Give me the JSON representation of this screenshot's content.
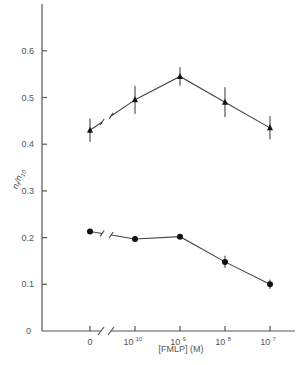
{
  "chart_data": {
    "type": "line",
    "title": "",
    "xlabel": "[FMLP] (M)",
    "ylabel": "n_f/n_10",
    "x_scale": "categorical (log concentration with axis break after 0)",
    "categories": [
      "0",
      "10^-10",
      "10^-9",
      "10^-8",
      "10^-7"
    ],
    "category_labels": [
      {
        "base": "0",
        "exp": ""
      },
      {
        "base": "10",
        "exp": "-10"
      },
      {
        "base": "10",
        "exp": "-9"
      },
      {
        "base": "10",
        "exp": "-8"
      },
      {
        "base": "10",
        "exp": "-7"
      }
    ],
    "yticks": [
      "0",
      "0.1",
      "0.2",
      "0.3",
      "0.4",
      "0.5",
      "0.6"
    ],
    "ylim": [
      0,
      0.7
    ],
    "grid": false,
    "legend": null,
    "axis_break_x": "between 0 and 10^-10",
    "series": [
      {
        "name": "triangles",
        "marker": "triangle",
        "values": [
          0.43,
          0.495,
          0.545,
          0.49,
          0.435
        ],
        "errors": [
          0.025,
          0.03,
          0.02,
          0.032,
          0.025
        ]
      },
      {
        "name": "circles",
        "marker": "circle",
        "values": [
          0.213,
          0.197,
          0.202,
          0.148,
          0.1
        ],
        "errors": [
          0.005,
          0.005,
          0.005,
          0.013,
          0.01
        ]
      }
    ]
  },
  "axes": {
    "x_title": "[FMLP] (M)",
    "y_title_main": "n",
    "y_title_sub1": "f",
    "y_title_sep": "/",
    "y_title_main2": "n",
    "y_title_sub2": "10"
  }
}
